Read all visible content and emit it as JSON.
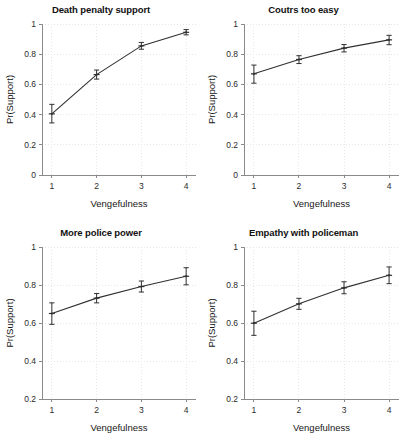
{
  "figure": {
    "layout": "2x2 grid of line plots with error bars",
    "background_color": "#ffffff",
    "line_color": "#303030",
    "grid_color": "#e6e6e6",
    "axis_color": "#8a8a8a"
  },
  "chart_data": [
    {
      "type": "line",
      "title": "Death penalty support",
      "xlabel": "Vengefulness",
      "ylabel": "Pr(Support)",
      "x": [
        1,
        2,
        3,
        4
      ],
      "xticklabels": [
        "1",
        "2",
        "3",
        "4"
      ],
      "xlim": [
        0.78,
        4.22
      ],
      "values": [
        0.405,
        0.665,
        0.855,
        0.945
      ],
      "err_low": [
        0.345,
        0.635,
        0.833,
        0.928
      ],
      "err_high": [
        0.468,
        0.695,
        0.878,
        0.963
      ],
      "ylim": [
        0,
        1
      ],
      "yticks": [
        0,
        0.2,
        0.4,
        0.6,
        0.8,
        1
      ],
      "yticklabels": [
        "0",
        "0.2",
        "0.4",
        "0.6",
        "0.8",
        "1"
      ],
      "grid": true,
      "legend": "none"
    },
    {
      "type": "line",
      "title": "Coutrs too easy",
      "xlabel": "Vengefulness",
      "ylabel": "Pr(Support)",
      "x": [
        1,
        2,
        3,
        4
      ],
      "xticklabels": [
        "1",
        "2",
        "3",
        "4"
      ],
      "xlim": [
        0.78,
        4.22
      ],
      "values": [
        0.67,
        0.765,
        0.84,
        0.895
      ],
      "err_low": [
        0.608,
        0.738,
        0.815,
        0.863
      ],
      "err_high": [
        0.728,
        0.79,
        0.864,
        0.925
      ],
      "ylim": [
        0,
        1
      ],
      "yticks": [
        0,
        0.2,
        0.4,
        0.6,
        0.8,
        1
      ],
      "yticklabels": [
        "0",
        "0.2",
        "0.4",
        "0.6",
        "0.8",
        "1"
      ],
      "grid": true,
      "legend": "none"
    },
    {
      "type": "line",
      "title": "More police power",
      "xlabel": "Vengefulness",
      "ylabel": "Pr(Support)",
      "x": [
        1,
        2,
        3,
        4
      ],
      "xticklabels": [
        "1",
        "2",
        "3",
        "4"
      ],
      "xlim": [
        0.78,
        4.22
      ],
      "values": [
        0.65,
        0.731,
        0.792,
        0.846
      ],
      "err_low": [
        0.593,
        0.706,
        0.763,
        0.801
      ],
      "err_high": [
        0.706,
        0.755,
        0.821,
        0.891
      ],
      "ylim": [
        0.2,
        1
      ],
      "yticks": [
        0.2,
        0.4,
        0.6,
        0.8,
        1
      ],
      "yticklabels": [
        "0.2",
        "0.4",
        "0.6",
        "0.8",
        "1"
      ],
      "grid": true,
      "legend": "none"
    },
    {
      "type": "line",
      "title": "Empathy with policeman",
      "xlabel": "Vengefulness",
      "ylabel": "Pr(Support)",
      "x": [
        1,
        2,
        3,
        4
      ],
      "xticklabels": [
        "1",
        "2",
        "3",
        "4"
      ],
      "xlim": [
        0.78,
        4.22
      ],
      "values": [
        0.599,
        0.701,
        0.785,
        0.851
      ],
      "err_low": [
        0.535,
        0.672,
        0.754,
        0.807
      ],
      "err_high": [
        0.662,
        0.73,
        0.817,
        0.895
      ],
      "ylim": [
        0.2,
        1
      ],
      "yticks": [
        0.2,
        0.4,
        0.6,
        0.8,
        1
      ],
      "yticklabels": [
        "0.2",
        "0.4",
        "0.6",
        "0.8",
        "1"
      ],
      "grid": true,
      "legend": "none"
    }
  ]
}
